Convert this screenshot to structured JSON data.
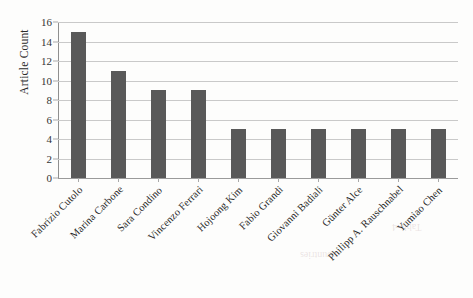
{
  "chart_data": {
    "type": "bar",
    "title": "",
    "xlabel": "",
    "ylabel": "Article Count",
    "categories": [
      "Fabrizio Cutolo",
      "Marina Carbone",
      "Sara Condino",
      "Vincenzo Ferrari",
      "Hojoong Kim",
      "Fabio Grandi",
      "Giovanni Badiali",
      "Günter Alce",
      "Philipp A. Rauschnabel",
      "Yumiao Chen"
    ],
    "values": [
      15,
      11,
      9,
      9,
      5,
      5,
      5,
      5,
      5,
      5
    ],
    "ylim": [
      0,
      16
    ],
    "y_ticks": [
      0,
      2,
      4,
      6,
      8,
      10,
      12,
      14,
      16
    ],
    "y_tick_labels": [
      "0",
      "2",
      "4",
      "6",
      "8",
      "10",
      "12",
      "14",
      "16"
    ],
    "grid": "horizontal",
    "legend": "none",
    "bar_color": "#595959",
    "gridline_color": "#c9c9c9",
    "background_color": "#fdfdfc",
    "text_color": "#262626"
  }
}
